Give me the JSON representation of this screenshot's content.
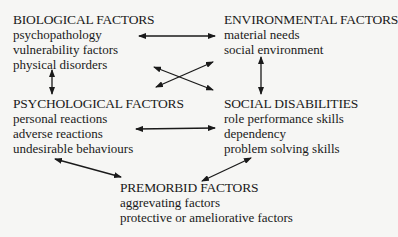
{
  "diagram": {
    "nodes": [
      {
        "id": "biological",
        "title": "BIOLOGICAL FACTORS",
        "items": [
          "psychopathology",
          "vulnerability factors",
          "physical disorders"
        ]
      },
      {
        "id": "environmental",
        "title": "ENVIRONMENTAL FACTORS",
        "items": [
          "material needs",
          "social environment"
        ]
      },
      {
        "id": "psychological",
        "title": "PSYCHOLOGICAL FACTORS",
        "items": [
          "personal reactions",
          "adverse reactions",
          "undesirable behaviours"
        ]
      },
      {
        "id": "social",
        "title": "SOCIAL DISABILITIES",
        "items": [
          "role performance skills",
          "dependency",
          "problem solving skills"
        ]
      },
      {
        "id": "premorbid",
        "title": "PREMORBID FACTORS",
        "items": [
          "aggrevating factors",
          "protective or ameliorative factors"
        ]
      }
    ],
    "edges": [
      {
        "from": "biological",
        "to": "environmental",
        "type": "bidirectional"
      },
      {
        "from": "biological",
        "to": "psychological",
        "type": "bidirectional"
      },
      {
        "from": "environmental",
        "to": "social",
        "type": "bidirectional"
      },
      {
        "from": "biological",
        "to": "social",
        "type": "bidirectional"
      },
      {
        "from": "environmental",
        "to": "psychological",
        "type": "bidirectional"
      },
      {
        "from": "psychological",
        "to": "social",
        "type": "bidirectional"
      },
      {
        "from": "psychological",
        "to": "premorbid",
        "type": "bidirectional"
      },
      {
        "from": "social",
        "to": "premorbid",
        "type": "bidirectional"
      }
    ]
  }
}
